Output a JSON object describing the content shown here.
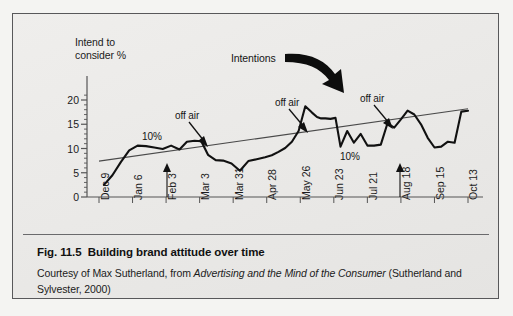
{
  "figure": {
    "caption_label": "Fig. 11.5",
    "caption_title": "Building brand attitude over time",
    "credit_pre": "Courtesy of Max Sutherland, from ",
    "credit_italic": "Advertising and the Mind of the Consumer",
    "credit_post": " (Sutherland and Sylvester, 2000)"
  },
  "chart_data": {
    "type": "line",
    "title": "",
    "ylabel": "Intend to\nconsider %",
    "xlabel": "",
    "ylim": [
      0,
      22
    ],
    "yticks": [
      0,
      5,
      10,
      15,
      20
    ],
    "ytick_labels": [
      "0",
      "5",
      "10",
      "15",
      "20"
    ],
    "grid": false,
    "legend": "none",
    "categories": [
      "Dec 9",
      "Jan 6",
      "Feb 3",
      "Mar 3",
      "Mar 31",
      "Apr 28",
      "May 26",
      "Jun 23",
      "Jul 21",
      "Aug 18",
      "Sep 15",
      "Oct 13"
    ],
    "series": [
      {
        "name": "Intend to consider %",
        "style": "thick-black",
        "x": [
          0.15,
          0.4,
          0.65,
          0.9,
          1.15,
          1.4,
          1.65,
          1.9,
          2.15,
          2.4,
          2.62,
          2.85,
          3.05,
          3.25,
          3.48,
          3.7,
          3.95,
          4.2,
          4.45,
          4.7,
          4.95,
          5.15,
          5.35,
          5.55,
          5.75,
          5.95,
          6.15,
          6.35,
          6.5,
          6.62,
          6.75,
          6.9,
          7.05,
          7.2,
          7.4,
          7.6,
          7.8,
          8.0,
          8.2,
          8.4,
          8.6,
          8.8,
          9.0,
          9.2,
          9.4,
          9.6,
          9.8,
          10.0,
          10.2,
          10.4,
          10.6,
          10.8,
          11.0
        ],
        "values": [
          2.5,
          4.5,
          7.2,
          9.6,
          10.6,
          10.5,
          10.2,
          9.9,
          10.6,
          9.8,
          11.4,
          11.6,
          11.5,
          8.7,
          7.6,
          7.5,
          6.9,
          5.4,
          7.4,
          7.8,
          8.2,
          8.6,
          9.3,
          10.1,
          11.4,
          13.6,
          18.7,
          17.4,
          16.5,
          16.2,
          16.2,
          16.1,
          16.3,
          10.4,
          13.6,
          11.2,
          13.0,
          10.6,
          10.6,
          10.8,
          15.2,
          14.3,
          16.0,
          17.8,
          17.0,
          15.0,
          12.2,
          10.2,
          10.4,
          11.4,
          11.2,
          17.6,
          17.8
        ]
      },
      {
        "name": "Intentions trend",
        "style": "thin-black",
        "x": [
          0,
          11
        ],
        "values": [
          7.4,
          18.2
        ]
      }
    ],
    "annotations": [
      {
        "text": "Intentions",
        "kind": "label",
        "x": 5.4,
        "y": 23.5
      },
      {
        "text": "off air",
        "kind": "arrow-down",
        "x": 3.0,
        "y": 14.6,
        "target_x": 3.35,
        "target_y": 9.2
      },
      {
        "text": "off air",
        "kind": "arrow-down",
        "x": 6.5,
        "y": 17.2,
        "target_x": 6.9,
        "target_y": 12.3
      },
      {
        "text": "off air",
        "kind": "arrow-down",
        "x": 9.0,
        "y": 18.3,
        "target_x": 9.4,
        "target_y": 13.4
      },
      {
        "text": "10%",
        "kind": "label",
        "x": 1.6,
        "y": 12.4
      },
      {
        "text": "10%",
        "kind": "label",
        "x": 8.5,
        "y": 8.6
      },
      {
        "text": "",
        "kind": "arrow-up",
        "x": 2.0,
        "y": 0,
        "target_y": 5.7
      },
      {
        "text": "",
        "kind": "arrow-up",
        "x": 8.95,
        "y": 0,
        "target_y": 5.7
      }
    ],
    "colors": {
      "series_line": "#111111",
      "trend_line": "#4a4a4a",
      "axis": "#555555",
      "text": "#1b1b1b",
      "panel_bg": "#edecea",
      "panel_border": "#58585a"
    }
  }
}
